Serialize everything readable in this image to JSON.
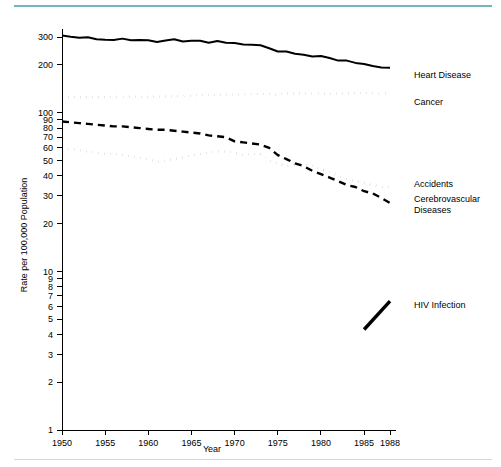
{
  "figure": {
    "y_axis_title": "Rate per 100,000 Population",
    "x_axis_title": "Year"
  },
  "chart_data": {
    "type": "line",
    "title": "",
    "subtitle": "",
    "xlabel": "Year",
    "ylabel": "Rate per 100,000 Population",
    "yscale": "log",
    "ylim": [
      1,
      330
    ],
    "xlim": [
      1950,
      1988
    ],
    "grid": false,
    "legend_position": "right-inline",
    "x_ticks": [
      1950,
      1955,
      1960,
      1965,
      1970,
      1975,
      1980,
      1985,
      1988
    ],
    "x_tick_labels": [
      "1950",
      "1955",
      "1960",
      "1965",
      "1970",
      "1975",
      "1980",
      "1985",
      "1988"
    ],
    "y_ticks": [
      1,
      2,
      3,
      4,
      5,
      6,
      7,
      8,
      9,
      10,
      20,
      30,
      40,
      50,
      60,
      70,
      80,
      90,
      100,
      200,
      300
    ],
    "y_tick_labels": [
      "1",
      "2",
      "3",
      "4",
      "5",
      "6",
      "7",
      "8",
      "9",
      "10",
      "20",
      "30",
      "40",
      "50",
      "60",
      "70",
      "80",
      "90",
      "100",
      "200",
      "300"
    ],
    "x": [
      1950,
      1951,
      1952,
      1953,
      1954,
      1955,
      1956,
      1957,
      1958,
      1959,
      1960,
      1961,
      1962,
      1963,
      1964,
      1965,
      1966,
      1967,
      1968,
      1969,
      1970,
      1971,
      1972,
      1973,
      1974,
      1975,
      1976,
      1977,
      1978,
      1979,
      1980,
      1981,
      1982,
      1983,
      1984,
      1985,
      1986,
      1987,
      1988
    ],
    "series": [
      {
        "name": "Heart Disease",
        "label": "Heart Disease",
        "style": "solid",
        "color": "#000000",
        "values": [
          307,
          301,
          297,
          299,
          290,
          288,
          287,
          293,
          286,
          287,
          286,
          279,
          285,
          290,
          281,
          284,
          284,
          276,
          283,
          276,
          275,
          269,
          268,
          266,
          255,
          243,
          243,
          235,
          232,
          226,
          228,
          221,
          213,
          213,
          206,
          203,
          197,
          193,
          192
        ]
      },
      {
        "name": "Cancer",
        "label": "Cancer",
        "style": "dotted",
        "color": "#000000",
        "values": [
          125,
          125,
          125,
          125,
          125,
          125,
          126,
          126,
          126,
          126,
          126,
          126,
          127,
          127,
          127,
          128,
          129,
          129,
          130,
          130,
          130,
          130,
          131,
          131,
          131,
          130,
          132,
          132,
          133,
          132,
          132,
          131,
          132,
          132,
          133,
          133,
          133,
          132,
          132
        ]
      },
      {
        "name": "Cerebrovascular Diseases",
        "label": "Cerebrovascular Diseases",
        "style": "dashed",
        "color": "#000000",
        "values": [
          88,
          87,
          86,
          85,
          84,
          83,
          82,
          82,
          81,
          80,
          79,
          78,
          78,
          77,
          76,
          75,
          74,
          72,
          71,
          70,
          66,
          65,
          64,
          63,
          60,
          54,
          51,
          48,
          46,
          43,
          41,
          39,
          37,
          35,
          34,
          32,
          31,
          29,
          27
        ]
      },
      {
        "name": "Accidents",
        "label": "Accidents",
        "style": "dotted",
        "color": "#000000",
        "values": [
          60,
          59,
          58,
          57,
          56,
          55,
          55,
          54,
          53,
          52,
          51,
          49,
          50,
          51,
          52,
          54,
          55,
          56,
          57,
          57,
          56,
          54,
          55,
          55,
          50,
          48,
          46,
          47,
          47,
          46,
          44,
          42,
          40,
          38,
          37,
          36,
          35,
          34,
          34
        ]
      },
      {
        "name": "HIV Infection",
        "label": "HIV Infection",
        "style": "solid-thick",
        "color": "#000000",
        "x": [
          1985,
          1988
        ],
        "values": [
          4.3,
          6.5
        ]
      }
    ]
  }
}
